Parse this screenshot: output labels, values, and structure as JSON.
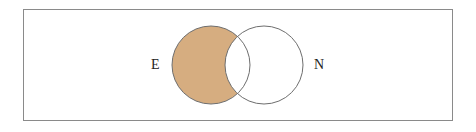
{
  "diagram": {
    "type": "venn",
    "sets": [
      {
        "label": "E",
        "cx": 211,
        "cy": 65,
        "r": 39
      },
      {
        "label": "N",
        "cx": 264,
        "cy": 65,
        "r": 39
      }
    ],
    "shaded_region": "E minus N",
    "colors": {
      "shade": "#d6ad80",
      "stroke": "#6e6e6e",
      "frame": "#8a8a8a"
    }
  }
}
